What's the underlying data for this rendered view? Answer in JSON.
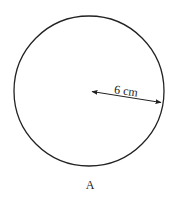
{
  "diagram": {
    "shape": "circle",
    "label": "A",
    "radius_label": "6 cm",
    "radius_value": 6,
    "radius_unit": "cm",
    "stroke_color": "#222222"
  }
}
